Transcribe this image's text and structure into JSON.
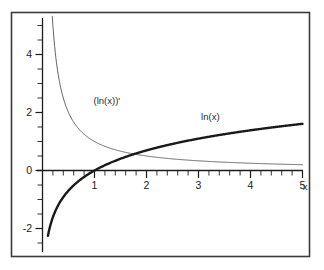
{
  "chart_data": {
    "type": "line",
    "title": "",
    "xlabel": "x",
    "ylabel": "",
    "xlim": [
      0,
      5
    ],
    "ylim": [
      -2.9,
      5.4
    ],
    "grid": false,
    "legend_position": "inline-annotations",
    "x_ticks_major": [
      1,
      2,
      3,
      4,
      5
    ],
    "x_tick_labels": [
      "1",
      "2",
      "3",
      "4",
      "5"
    ],
    "x_tick_minor_step": 0.2,
    "y_ticks_major": [
      -2,
      0,
      2,
      4
    ],
    "y_tick_labels": [
      "-2",
      "0",
      "2",
      "4"
    ],
    "y_tick_minor_step": 0.5,
    "series": [
      {
        "name": "ln(x)",
        "label": "ln(x)",
        "style": "thick",
        "color": "#1a1a1a",
        "width": 2.4,
        "label_x": 3.05,
        "label_y": 1.75,
        "x_start": 0.105,
        "x_end": 5.0,
        "points_x": [
          0.105,
          0.15,
          0.2,
          0.3,
          0.4,
          0.5,
          0.6,
          0.7,
          0.8,
          0.9,
          1.0,
          1.2,
          1.4,
          1.6,
          1.8,
          2.0,
          2.25,
          2.5,
          2.75,
          3.0,
          3.25,
          3.5,
          3.75,
          4.0,
          4.25,
          4.5,
          4.75,
          5.0
        ],
        "points_y": [
          -2.25,
          -1.9,
          -1.61,
          -1.2,
          -0.92,
          -0.69,
          -0.51,
          -0.36,
          -0.22,
          -0.11,
          0.0,
          0.18,
          0.34,
          0.47,
          0.59,
          0.69,
          0.81,
          0.92,
          1.01,
          1.1,
          1.18,
          1.25,
          1.32,
          1.39,
          1.45,
          1.5,
          1.56,
          1.61
        ]
      },
      {
        "name": "(ln(x))'",
        "label": "(ln(x))'",
        "style": "thin",
        "color": "#555555",
        "width": 0.9,
        "label_x": 0.98,
        "label_y": 2.28,
        "x_start": 0.188,
        "x_end": 5.0,
        "points_x": [
          0.188,
          0.22,
          0.26,
          0.3,
          0.35,
          0.4,
          0.45,
          0.5,
          0.6,
          0.7,
          0.8,
          0.9,
          1.0,
          1.2,
          1.4,
          1.6,
          1.8,
          2.0,
          2.25,
          2.5,
          2.75,
          3.0,
          3.5,
          4.0,
          4.5,
          5.0
        ],
        "points_y": [
          5.32,
          4.55,
          3.85,
          3.33,
          2.86,
          2.5,
          2.22,
          2.0,
          1.67,
          1.43,
          1.25,
          1.11,
          1.0,
          0.83,
          0.71,
          0.625,
          0.556,
          0.5,
          0.444,
          0.4,
          0.364,
          0.333,
          0.286,
          0.25,
          0.222,
          0.2
        ]
      }
    ],
    "intersection": {
      "x": 1.763,
      "y": 0.567
    },
    "zero_crossing_ln": {
      "x": 1.0,
      "y": 0.0
    }
  },
  "figure": {
    "frame_color": "#3a3a3a",
    "background": "#ffffff",
    "axis_color": "#1c1c1c"
  }
}
